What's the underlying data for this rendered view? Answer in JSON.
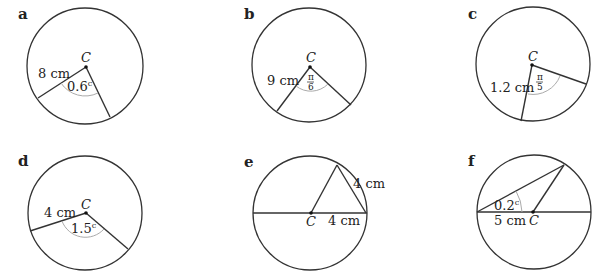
{
  "diagrams": [
    {
      "part": "a",
      "centre_label": "C",
      "radius_label": "8 cm",
      "angle_label": "0.6",
      "angle_unit": "c"
    },
    {
      "part": "b",
      "centre_label": "C",
      "radius_label": "9 cm",
      "angle_num": "π",
      "angle_den": "6"
    },
    {
      "part": "c",
      "centre_label": "C",
      "radius_label": "1.2 cm",
      "angle_num": "π",
      "angle_den": "5"
    },
    {
      "part": "d",
      "centre_label": "C",
      "radius_label": "4 cm",
      "angle_label": "1.5",
      "angle_unit": "c"
    },
    {
      "part": "e",
      "centre_label": "C",
      "chord_label": "4 cm",
      "radius_label": "4 cm"
    },
    {
      "part": "f",
      "centre_label": "C",
      "radius_label": "5 cm",
      "angle_label": "0.2",
      "angle_unit": "c"
    }
  ]
}
